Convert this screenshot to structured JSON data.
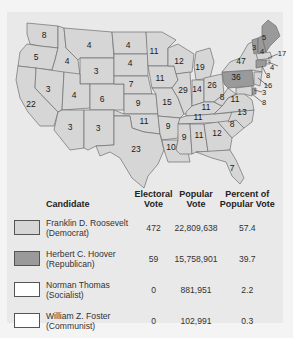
{
  "map": {
    "colors": {
      "democrat": "#d6d6d6",
      "republican": "#9a9a9a",
      "border": "#6e6e6e",
      "background": "#e9e9e9"
    },
    "states": [
      {
        "abbr": "WA",
        "ev": "8",
        "party": "democrat"
      },
      {
        "abbr": "OR",
        "ev": "5",
        "party": "democrat"
      },
      {
        "abbr": "CA",
        "ev": "22",
        "party": "democrat"
      },
      {
        "abbr": "ID",
        "ev": "4",
        "party": "democrat"
      },
      {
        "abbr": "NV",
        "ev": "3",
        "party": "democrat"
      },
      {
        "abbr": "MT",
        "ev": "4",
        "party": "democrat"
      },
      {
        "abbr": "WY",
        "ev": "3",
        "party": "democrat"
      },
      {
        "abbr": "UT",
        "ev": "4",
        "party": "democrat"
      },
      {
        "abbr": "CO",
        "ev": "6",
        "party": "democrat"
      },
      {
        "abbr": "AZ",
        "ev": "3",
        "party": "democrat"
      },
      {
        "abbr": "NM",
        "ev": "3",
        "party": "democrat"
      },
      {
        "abbr": "ND",
        "ev": "4",
        "party": "democrat"
      },
      {
        "abbr": "SD",
        "ev": "4",
        "party": "democrat"
      },
      {
        "abbr": "NE",
        "ev": "7",
        "party": "democrat"
      },
      {
        "abbr": "KS",
        "ev": "9",
        "party": "democrat"
      },
      {
        "abbr": "OK",
        "ev": "11",
        "party": "democrat"
      },
      {
        "abbr": "TX",
        "ev": "23",
        "party": "democrat"
      },
      {
        "abbr": "MN",
        "ev": "11",
        "party": "democrat"
      },
      {
        "abbr": "IA",
        "ev": "11",
        "party": "democrat"
      },
      {
        "abbr": "MO",
        "ev": "15",
        "party": "democrat"
      },
      {
        "abbr": "AR",
        "ev": "9",
        "party": "democrat"
      },
      {
        "abbr": "LA",
        "ev": "10",
        "party": "democrat"
      },
      {
        "abbr": "WI",
        "ev": "12",
        "party": "democrat"
      },
      {
        "abbr": "IL",
        "ev": "29",
        "party": "democrat"
      },
      {
        "abbr": "MI",
        "ev": "19",
        "party": "democrat"
      },
      {
        "abbr": "IN",
        "ev": "14",
        "party": "democrat"
      },
      {
        "abbr": "OH",
        "ev": "26",
        "party": "democrat"
      },
      {
        "abbr": "KY",
        "ev": "11",
        "party": "democrat"
      },
      {
        "abbr": "TN",
        "ev": "11",
        "party": "democrat"
      },
      {
        "abbr": "MS",
        "ev": "9",
        "party": "democrat"
      },
      {
        "abbr": "AL",
        "ev": "11",
        "party": "democrat"
      },
      {
        "abbr": "GA",
        "ev": "12",
        "party": "democrat"
      },
      {
        "abbr": "FL",
        "ev": "7",
        "party": "democrat"
      },
      {
        "abbr": "SC",
        "ev": "8",
        "party": "democrat"
      },
      {
        "abbr": "NC",
        "ev": "13",
        "party": "democrat"
      },
      {
        "abbr": "VA",
        "ev": "11",
        "party": "democrat"
      },
      {
        "abbr": "WV",
        "ev": "8",
        "party": "democrat"
      },
      {
        "abbr": "PA",
        "ev": "36",
        "party": "republican"
      },
      {
        "abbr": "NY",
        "ev": "47",
        "party": "democrat"
      },
      {
        "abbr": "VT",
        "ev": "3",
        "party": "republican"
      },
      {
        "abbr": "NH",
        "ev": "4",
        "party": "republican"
      },
      {
        "abbr": "ME",
        "ev": "5",
        "party": "republican"
      },
      {
        "abbr": "MA",
        "ev": "17",
        "party": "democrat"
      },
      {
        "abbr": "RI",
        "ev": "4",
        "party": "democrat"
      },
      {
        "abbr": "CT",
        "ev": "8",
        "party": "republican"
      },
      {
        "abbr": "NJ",
        "ev": "16",
        "party": "democrat"
      },
      {
        "abbr": "DE",
        "ev": "3",
        "party": "republican"
      },
      {
        "abbr": "MD",
        "ev": "8",
        "party": "democrat"
      }
    ]
  },
  "table": {
    "headers": {
      "candidate": "Candidate",
      "electoral_1": "Electoral",
      "electoral_2": "Vote",
      "popular_1": "Popular",
      "popular_2": "Vote",
      "percent_1": "Percent of",
      "percent_2": "Popular Vote"
    },
    "rows": [
      {
        "name": "Franklin D. Roosevelt",
        "party": "(Democrat)",
        "electoral": "472",
        "popular": "22,809,638",
        "percent": "57.4",
        "swatch": "#d6d6d6"
      },
      {
        "name": "Herbert C. Hoover",
        "party": "(Republican)",
        "electoral": "59",
        "popular": "15,758,901",
        "percent": "39.7",
        "swatch": "#9a9a9a"
      },
      {
        "name": "Norman Thomas",
        "party": "(Socialist)",
        "electoral": "0",
        "popular": "881,951",
        "percent": "2.2",
        "swatch": "#ffffff"
      },
      {
        "name": "William Z. Foster",
        "party": "(Communist)",
        "electoral": "0",
        "popular": "102,991",
        "percent": "0.3",
        "swatch": "#ffffff"
      }
    ]
  }
}
